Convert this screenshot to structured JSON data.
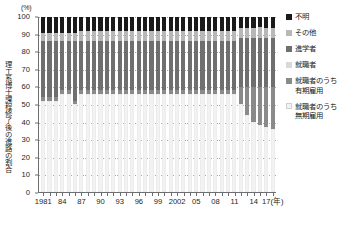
{
  "axis": {
    "unit_label": "(%)",
    "vertical_caption": "理工系博士課程修了後の進路の割合",
    "x_unit": "(年)",
    "y_ticks": [
      "100",
      "90",
      "80",
      "70",
      "60",
      "50",
      "40",
      "30",
      "20",
      "10",
      "0"
    ],
    "x_tick_labels": [
      "1981",
      "84",
      "87",
      "90",
      "93",
      "96",
      "99",
      "2002",
      "05",
      "08",
      "11",
      "14",
      "17(年)"
    ]
  },
  "legend": {
    "items": [
      {
        "label": "不明",
        "color": "#1a1a1a"
      },
      {
        "label": "その他",
        "color": "#b8b8b8"
      },
      {
        "label": "進学者",
        "color": "#6f6f6f"
      },
      {
        "label": "就職者",
        "color": "#d9d9d9"
      },
      {
        "label": "就職者のうち\n有期雇用",
        "color": "#8a8a8a"
      },
      {
        "label": "就職者のうち\n無期雇用",
        "color": "#f2f2f2"
      }
    ]
  },
  "chart_data": {
    "type": "bar",
    "title": "理工系博士課程修了後の進路の割合",
    "xlabel": "(年)",
    "ylabel": "理工系博士課程修了後の進路の割合",
    "unit": "%",
    "ylim": [
      0,
      100
    ],
    "grid": true,
    "stacked": true,
    "stack_total": 100,
    "legend_position": "right",
    "categories": [
      "1981",
      "1982",
      "1983",
      "1984",
      "1985",
      "1986",
      "1987",
      "1988",
      "1989",
      "1990",
      "1991",
      "1992",
      "1993",
      "1994",
      "1995",
      "1996",
      "1997",
      "1998",
      "1999",
      "2000",
      "2001",
      "2002",
      "2003",
      "2004",
      "2005",
      "2006",
      "2007",
      "2008",
      "2009",
      "2010",
      "2011",
      "2012",
      "2013",
      "2014",
      "2015",
      "2016",
      "2017"
    ],
    "series": [
      {
        "name": "就職者のうち無期雇用",
        "color": "#f2f2f2",
        "values": [
          52,
          52,
          52,
          56,
          56,
          50,
          56,
          56,
          56,
          56,
          56,
          56,
          56,
          56,
          56,
          56,
          56,
          56,
          56,
          56,
          56,
          56,
          56,
          56,
          56,
          56,
          56,
          56,
          56,
          56,
          56,
          50,
          44,
          40,
          38,
          37,
          36
        ]
      },
      {
        "name": "就職者のうち有期雇用",
        "color": "#8a8a8a",
        "values": [
          2,
          2,
          2,
          2,
          2,
          2,
          2,
          2,
          2,
          2,
          2,
          2,
          2,
          2,
          2,
          2,
          2,
          2,
          2,
          2,
          2,
          2,
          2,
          2,
          2,
          2,
          2,
          2,
          2,
          2,
          2,
          10,
          16,
          20,
          22,
          23,
          24
        ]
      },
      {
        "name": "進学者",
        "color": "#6f6f6f",
        "values": [
          32,
          32,
          32,
          28,
          28,
          34,
          28,
          28,
          28,
          28,
          28,
          28,
          28,
          28,
          28,
          28,
          28,
          28,
          28,
          28,
          28,
          28,
          28,
          28,
          28,
          28,
          28,
          28,
          28,
          28,
          28,
          28,
          28,
          28,
          28,
          28,
          28
        ]
      },
      {
        "name": "その他",
        "color": "#b8b8b8",
        "values": [
          5,
          5,
          5,
          5,
          5,
          5,
          6,
          6,
          6,
          6,
          6,
          6,
          6,
          6,
          6,
          6,
          6,
          6,
          6,
          6,
          6,
          6,
          6,
          6,
          6,
          6,
          6,
          6,
          6,
          6,
          6,
          6,
          6,
          6,
          6,
          6,
          6
        ]
      },
      {
        "name": "不明",
        "color": "#1a1a1a",
        "values": [
          9,
          9,
          9,
          9,
          9,
          9,
          8,
          8,
          8,
          8,
          8,
          8,
          8,
          8,
          8,
          8,
          8,
          8,
          8,
          8,
          8,
          8,
          8,
          8,
          8,
          8,
          8,
          8,
          8,
          8,
          8,
          6,
          6,
          6,
          6,
          6,
          6
        ]
      }
    ],
    "note": "Stacked 100% composition of post-doctoral-course career paths; bottom two segments are sub-categories of 就職者."
  }
}
